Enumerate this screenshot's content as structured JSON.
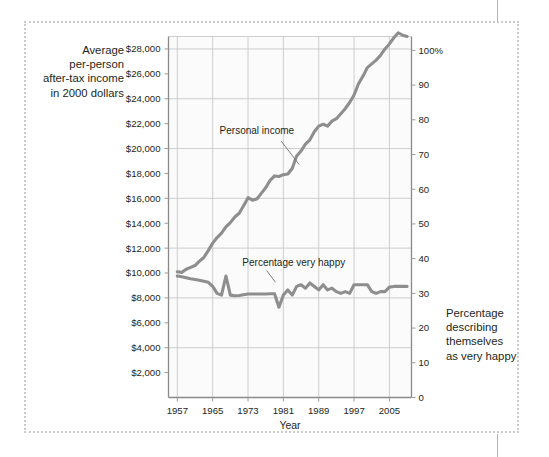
{
  "figure": {
    "left_caption_lines": [
      "Average",
      "per-person",
      "after-tax income",
      "in 2000 dollars"
    ],
    "right_caption_lines": [
      "Percentage",
      "describing",
      "themselves",
      "as very happy"
    ],
    "frame_style": "dotted",
    "line_color": "#8e8e8e",
    "grid_color": "#c8c8c8",
    "plot_bg": "#fbfbfb",
    "axis_color": "#9a9a9a"
  },
  "chart_data": {
    "type": "line",
    "title": "",
    "subtitle": "",
    "xlabel": "Year",
    "ylabel": "Average per-person after-tax income in 2000 dollars",
    "y2label": "Percentage describing themselves as very happy",
    "xlim": [
      1955,
      2010
    ],
    "ylim": [
      0,
      29000
    ],
    "y2lim": [
      0,
      104
    ],
    "grid": true,
    "legend": "inline-annotations",
    "xticks": [
      1957,
      1965,
      1973,
      1981,
      1989,
      1997,
      2005
    ],
    "xticklabels": [
      "1957",
      "1965",
      "1973",
      "1981",
      "1989",
      "1997",
      "2005"
    ],
    "yticks": [
      2000,
      4000,
      6000,
      8000,
      10000,
      12000,
      14000,
      16000,
      18000,
      20000,
      22000,
      24000,
      26000,
      28000
    ],
    "yticklabels": [
      "$2,000",
      "$4,000",
      "$6,000",
      "$8,000",
      "$10,000",
      "$12,000",
      "$14,000",
      "$16,000",
      "$18,000",
      "$20,000",
      "$22,000",
      "$24,000",
      "$26,000",
      "$28,000"
    ],
    "y2ticks": [
      0,
      10,
      20,
      30,
      40,
      50,
      60,
      70,
      80,
      90,
      100
    ],
    "y2ticklabels": [
      "0",
      "10",
      "20",
      "30",
      "40",
      "50",
      "60",
      "70",
      "80",
      "90",
      "100%"
    ],
    "gridline_years": [
      1957,
      1965,
      1973,
      1981,
      1989,
      1997,
      2005
    ],
    "gridline_values": [
      4000,
      8000,
      12000,
      16000,
      20000,
      24000,
      28000
    ],
    "series": [
      {
        "name": "Personal income",
        "axis": "left",
        "units": "2000 dollars",
        "label_x": 1975,
        "label_y": 21200,
        "x": [
          1957,
          1958,
          1959,
          1960,
          1961,
          1962,
          1963,
          1964,
          1965,
          1966,
          1967,
          1968,
          1969,
          1970,
          1971,
          1972,
          1973,
          1974,
          1975,
          1976,
          1977,
          1978,
          1979,
          1980,
          1981,
          1982,
          1983,
          1984,
          1985,
          1986,
          1987,
          1988,
          1989,
          1990,
          1991,
          1992,
          1993,
          1994,
          1995,
          1996,
          1997,
          1998,
          1999,
          2000,
          2001,
          2002,
          2003,
          2004,
          2005,
          2006,
          2007,
          2008,
          2009
        ],
        "values": [
          10100,
          10050,
          10300,
          10450,
          10600,
          10950,
          11250,
          11800,
          12400,
          12850,
          13200,
          13700,
          14050,
          14500,
          14800,
          15400,
          16050,
          15850,
          15950,
          16400,
          16850,
          17450,
          17800,
          17750,
          17900,
          17950,
          18400,
          19400,
          19800,
          20350,
          20700,
          21350,
          21800,
          21950,
          21800,
          22200,
          22400,
          22800,
          23200,
          23700,
          24300,
          25200,
          25800,
          26500,
          26800,
          27100,
          27500,
          28000,
          28400,
          28900,
          29300,
          29100,
          29000
        ]
      },
      {
        "name": "Percentage very happy",
        "axis": "right",
        "units": "percent",
        "label_x": 1982,
        "label_y_pct": 38,
        "x": [
          1957,
          1958,
          1959,
          1960,
          1961,
          1962,
          1963,
          1964,
          1965,
          1966,
          1967,
          1968,
          1969,
          1970,
          1971,
          1972,
          1973,
          1974,
          1975,
          1976,
          1977,
          1978,
          1979,
          1980,
          1981,
          1982,
          1983,
          1984,
          1985,
          1986,
          1987,
          1988,
          1989,
          1990,
          1991,
          1992,
          1993,
          1994,
          1995,
          1996,
          1997,
          1998,
          1999,
          2000,
          2001,
          2002,
          2003,
          2004,
          2005,
          2006,
          2007,
          2008,
          2009
        ],
        "values": [
          35,
          34.8,
          34.5,
          34.2,
          34,
          33.8,
          33.5,
          33.2,
          32,
          30,
          29.5,
          35,
          29.5,
          29.3,
          29.4,
          29.6,
          29.8,
          29.8,
          29.8,
          29.8,
          29.8,
          29.9,
          29.9,
          26,
          29.5,
          31,
          29.5,
          32,
          32.5,
          31.5,
          33,
          32,
          31,
          32.5,
          31,
          31.5,
          30.5,
          30,
          30.5,
          30,
          32.5,
          32.5,
          32.5,
          32.5,
          30.5,
          30,
          30.5,
          30.5,
          31.8,
          32,
          32,
          32,
          32
        ]
      }
    ],
    "annotations": [
      {
        "text": "Personal income",
        "series": "income"
      },
      {
        "text": "Percentage very happy",
        "series": "happy"
      }
    ]
  },
  "axes": {
    "x_axis_title": "Year",
    "right_axis_suffix": "%"
  }
}
